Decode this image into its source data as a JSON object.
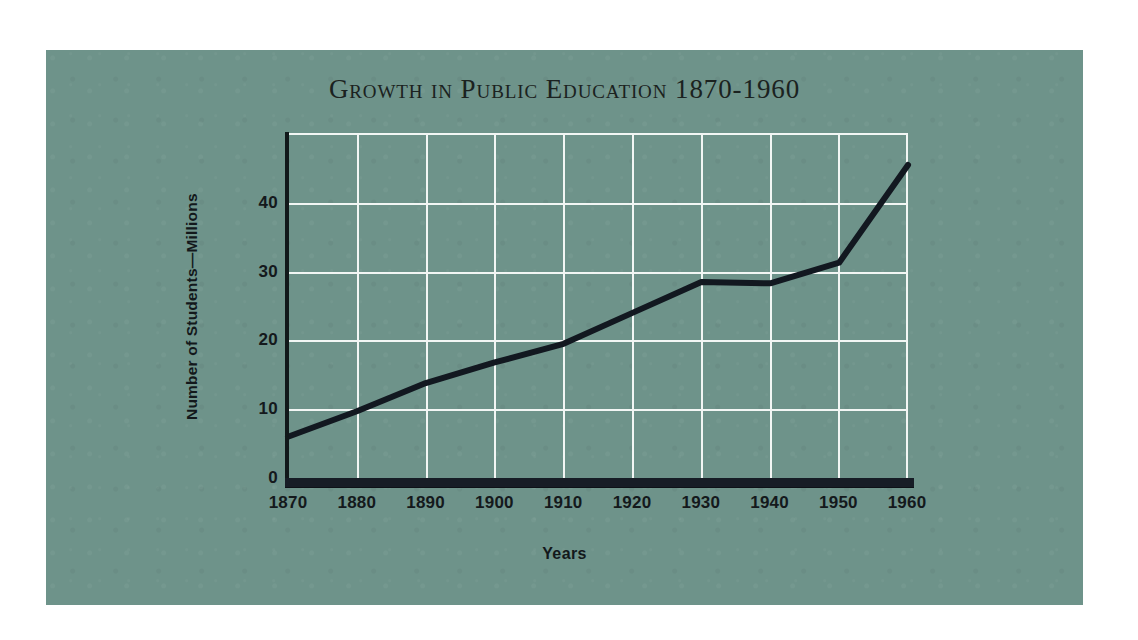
{
  "page": {
    "background_color": "#ffffff",
    "panel_color": "#6e938a"
  },
  "title": "Growth in Public Education 1870-1960",
  "chart_data": {
    "type": "line",
    "title": "Growth in Public Education 1870-1960",
    "xlabel": "Years",
    "ylabel": "Number of Students—Millions",
    "categories": [
      "1870",
      "1880",
      "1890",
      "1900",
      "1910",
      "1920",
      "1930",
      "1940",
      "1950",
      "1960"
    ],
    "x": [
      1870,
      1880,
      1890,
      1900,
      1910,
      1920,
      1930,
      1940,
      1950,
      1960
    ],
    "values": [
      6,
      9.7,
      13.8,
      16.8,
      19.5,
      24,
      28.5,
      28.3,
      31.3,
      45.5
    ],
    "series": [
      {
        "name": "Number of Students—Millions",
        "values": [
          6,
          9.7,
          13.8,
          16.8,
          19.5,
          24,
          28.5,
          28.3,
          31.3,
          45.5
        ]
      }
    ],
    "xlim": [
      1870,
      1960
    ],
    "ylim": [
      0,
      50
    ],
    "yticks": [
      0,
      10,
      20,
      30,
      40
    ],
    "ytick_labels": [
      "0",
      "10",
      "20",
      "30",
      "40"
    ],
    "xtick_labels": [
      "1870",
      "1880",
      "1890",
      "1900",
      "1910",
      "1920",
      "1930",
      "1940",
      "1950",
      "1960"
    ],
    "grid": true,
    "grid_color": "#f2f6f4",
    "line_color": "#121820",
    "legend": false,
    "legend_position": "none"
  },
  "axes": {
    "y_label": "Number of Students—Millions",
    "x_label": "Years",
    "y_tick_labels": [
      "0",
      "10",
      "20",
      "30",
      "40"
    ],
    "x_tick_labels": [
      "1870",
      "1880",
      "1890",
      "1900",
      "1910",
      "1920",
      "1930",
      "1940",
      "1950",
      "1960"
    ]
  }
}
